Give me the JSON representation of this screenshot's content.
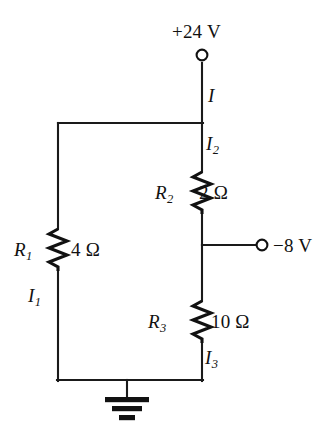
{
  "figure": {
    "width": 332,
    "height": 441,
    "background_color": "#ffffff",
    "wire_color": "#1a1a1a"
  },
  "terminals": [
    {
      "id": "supply-24v",
      "name": "positive-supply-terminal",
      "label": "+24 V",
      "symbol": "open-circle-terminal",
      "x": 202,
      "y": 55
    },
    {
      "id": "supply-n8v",
      "name": "negative-supply-terminal",
      "label": "−8 V",
      "symbol": "open-circle-terminal",
      "x": 262,
      "y": 245
    }
  ],
  "ground": {
    "name": "ground-symbol",
    "label": "",
    "x": 127,
    "y": 380
  },
  "resistors": [
    {
      "id": "R1",
      "name": "resistor-r1",
      "designator": "R",
      "subscript": "1",
      "value": "4 Ω",
      "resistance_ohms": 4,
      "orientation": "vertical",
      "x": 58,
      "y_center": 250
    },
    {
      "id": "R2",
      "name": "resistor-r2",
      "designator": "R",
      "subscript": "2",
      "value": "2 Ω",
      "resistance_ohms": 2,
      "orientation": "vertical",
      "x": 202,
      "y_center": 193
    },
    {
      "id": "R3",
      "name": "resistor-r3",
      "designator": "R",
      "subscript": "3",
      "value": "10 Ω",
      "resistance_ohms": 10,
      "orientation": "vertical",
      "x": 202,
      "y_center": 322
    }
  ],
  "currents": [
    {
      "id": "I",
      "name": "current-label-i",
      "designator": "I",
      "subscript": "",
      "branch": "supply-24v-to-top-node"
    },
    {
      "id": "I1",
      "name": "current-label-i1",
      "designator": "I",
      "subscript": "1",
      "branch": "left-rail-through-r1"
    },
    {
      "id": "I2",
      "name": "current-label-i2",
      "designator": "I",
      "subscript": "2",
      "branch": "right-rail-through-r2"
    },
    {
      "id": "I3",
      "name": "current-label-i3",
      "designator": "I",
      "subscript": "3",
      "branch": "right-rail-through-r3"
    }
  ]
}
